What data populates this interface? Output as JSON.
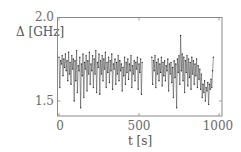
{
  "chart_data": {
    "type": "line",
    "title": "",
    "xlabel": "t [s]",
    "ylabel": "Δ [GHz]",
    "xlim": [
      -15,
      1020
    ],
    "ylim": [
      1.41,
      2.0
    ],
    "xticks": [
      0,
      500,
      1000
    ],
    "xtick_labels": [
      "0",
      "500",
      "1000"
    ],
    "yticks": [
      1.5,
      2.0
    ],
    "ytick_labels": [
      "1.5",
      "2.0"
    ],
    "grid": false,
    "legend": null,
    "series": [
      {
        "name": "Δ",
        "marker": "dot",
        "color": "#444444",
        "segments": [
          {
            "t": [
              0,
              5,
              10,
              15,
              20,
              25,
              30,
              35,
              40,
              45,
              50,
              55,
              60,
              65,
              70,
              75,
              80,
              85,
              90,
              95,
              100,
              105,
              110,
              115,
              120,
              125,
              130,
              135,
              140,
              145,
              150,
              155,
              160,
              165,
              170,
              175,
              180,
              185,
              190,
              195,
              200,
              205,
              210,
              215,
              220,
              225,
              230,
              235,
              240,
              245,
              250,
              255,
              260,
              265,
              270,
              275,
              280,
              285,
              290,
              295,
              300,
              305,
              310,
              315,
              320,
              325,
              330,
              335,
              340,
              345,
              350,
              355,
              360,
              365,
              370,
              375,
              380,
              385,
              390,
              395,
              400,
              405,
              410,
              415,
              420,
              425,
              430,
              435,
              440,
              445,
              450,
              455,
              460,
              465,
              470,
              475,
              480,
              485,
              490,
              495,
              500,
              505,
              510,
              515,
              520
            ],
            "values": [
              1.76,
              1.58,
              1.74,
              1.72,
              1.77,
              1.65,
              1.75,
              1.7,
              1.78,
              1.68,
              1.74,
              1.62,
              1.79,
              1.66,
              1.73,
              1.6,
              1.77,
              1.69,
              1.75,
              1.5,
              1.74,
              1.62,
              1.8,
              1.55,
              1.71,
              1.68,
              1.76,
              1.46,
              1.72,
              1.65,
              1.78,
              1.52,
              1.73,
              1.69,
              1.77,
              1.56,
              1.74,
              1.66,
              1.79,
              1.6,
              1.72,
              1.68,
              1.77,
              1.58,
              1.75,
              1.66,
              1.8,
              1.55,
              1.73,
              1.7,
              1.78,
              1.54,
              1.74,
              1.66,
              1.77,
              1.62,
              1.75,
              1.69,
              1.79,
              1.58,
              1.73,
              1.67,
              1.76,
              1.61,
              1.74,
              1.68,
              1.78,
              1.57,
              1.72,
              1.69,
              1.75,
              1.6,
              1.73,
              1.66,
              1.77,
              1.62,
              1.74,
              1.68,
              1.72,
              1.56,
              1.7,
              1.65,
              1.76,
              1.6,
              1.73,
              1.67,
              1.75,
              1.63,
              1.72,
              1.68,
              1.77,
              1.58,
              1.71,
              1.66,
              1.74,
              1.62,
              1.73,
              1.69,
              1.76,
              1.57,
              1.72,
              1.67,
              1.75,
              1.54,
              1.73
            ]
          },
          {
            "t": [
              580,
              585,
              590,
              595,
              600,
              605,
              610,
              615,
              620,
              625,
              630,
              635,
              640,
              645,
              650,
              655,
              660,
              665,
              670,
              675,
              680,
              685,
              690,
              695,
              700,
              705,
              710,
              715,
              720,
              725,
              730,
              735,
              740,
              745,
              750,
              755,
              760,
              765,
              770,
              775,
              780,
              785,
              790,
              795,
              800,
              805,
              810,
              815,
              820,
              825,
              830,
              835,
              840,
              845,
              850,
              855,
              860,
              865,
              870,
              875,
              880,
              885,
              890,
              895,
              900,
              905,
              910,
              915,
              920,
              925,
              930,
              935,
              940,
              945,
              950,
              955,
              960,
              965
            ],
            "values": [
              1.76,
              1.6,
              1.74,
              1.68,
              1.77,
              1.58,
              1.73,
              1.66,
              1.75,
              1.62,
              1.72,
              1.67,
              1.76,
              1.59,
              1.73,
              1.65,
              1.74,
              1.62,
              1.71,
              1.68,
              1.75,
              1.56,
              1.72,
              1.66,
              1.73,
              1.61,
              1.7,
              1.52,
              1.74,
              1.64,
              1.72,
              1.46,
              1.75,
              1.67,
              1.77,
              1.6,
              1.89,
              1.68,
              1.78,
              1.62,
              1.76,
              1.55,
              1.74,
              1.67,
              1.77,
              1.59,
              1.75,
              1.64,
              1.73,
              1.57,
              1.76,
              1.66,
              1.74,
              1.6,
              1.72,
              1.65,
              1.75,
              1.58,
              1.71,
              1.63,
              1.69,
              1.57,
              1.66,
              1.52,
              1.6,
              1.55,
              1.62,
              1.5,
              1.58,
              1.56,
              1.61,
              1.48,
              1.6,
              1.57,
              1.63,
              1.58,
              1.68,
              1.76
            ]
          }
        ]
      }
    ]
  },
  "axes": {
    "ylabel_text": "Δ [GHz]",
    "xlabel_text": "t [s]",
    "ytick_top": "2.0",
    "ytick_bottom": "1.5",
    "xtick_0": "0",
    "xtick_500": "500",
    "xtick_1000": "1000"
  }
}
